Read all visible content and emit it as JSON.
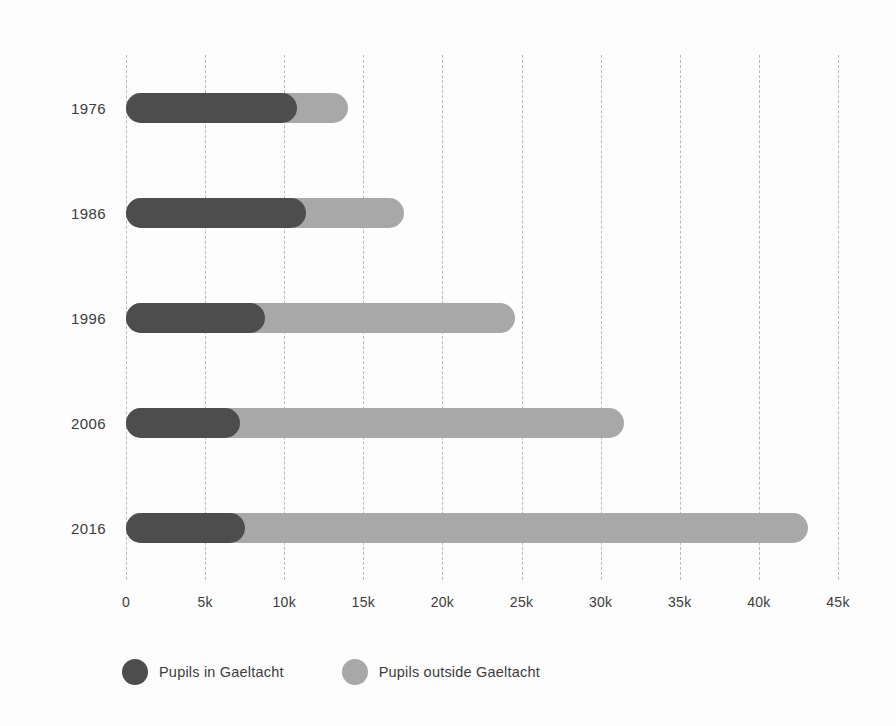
{
  "chart_data": {
    "type": "bar",
    "orientation": "horizontal",
    "stacked": true,
    "title": "",
    "subtitle": "",
    "xlabel": "",
    "ylabel": "",
    "xlim": [
      0,
      45000
    ],
    "x_tick_values": [
      0,
      5000,
      10000,
      15000,
      20000,
      25000,
      30000,
      35000,
      40000,
      45000
    ],
    "x_tick_labels": [
      "0",
      "5k",
      "10k",
      "15k",
      "20k",
      "25k",
      "30k",
      "35k",
      "40k",
      "45k"
    ],
    "categories": [
      "1976",
      "1986",
      "1996",
      "2006",
      "2016"
    ],
    "grid": "vertical-dashed",
    "legend_position": "bottom-left",
    "series": [
      {
        "name": "Pupils in Gaeltacht",
        "color": "#4d4d4d",
        "values": [
          10800,
          11400,
          8800,
          7200,
          7500
        ]
      },
      {
        "name": "Pupils outside Gaeltacht",
        "color": "#a8a8a8",
        "values": [
          3200,
          6200,
          15800,
          24300,
          35600
        ]
      }
    ],
    "totals": [
      14000,
      17600,
      24600,
      31500,
      43100
    ]
  },
  "axes": {
    "y_labels": [
      "1976",
      "1986",
      "1996",
      "2006",
      "2016"
    ],
    "x_labels": [
      "0",
      "5k",
      "10k",
      "15k",
      "20k",
      "25k",
      "30k",
      "35k",
      "40k",
      "45k"
    ]
  },
  "legend": {
    "items": [
      {
        "label": "Pupils in Gaeltacht",
        "color": "#4d4d4d"
      },
      {
        "label": "Pupils outside Gaeltacht",
        "color": "#a8a8a8"
      }
    ]
  },
  "colors": {
    "background": "#fdfdfd",
    "gridline": "#b9b9b9",
    "text": "#3c3c3c",
    "series_dark": "#4d4d4d",
    "series_light": "#a8a8a8"
  }
}
